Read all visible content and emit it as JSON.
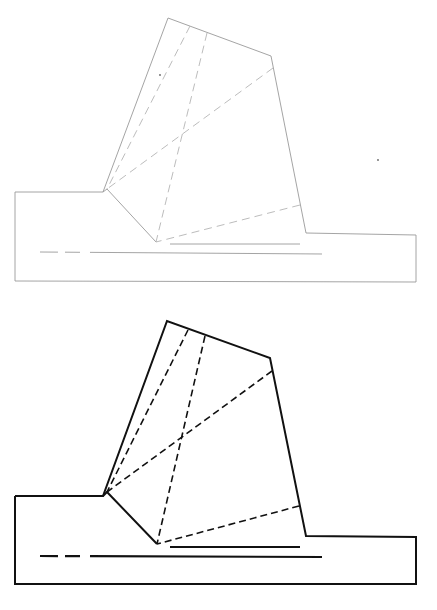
{
  "figure": {
    "panels": [
      {
        "id": "sketch",
        "style": "faint pencil",
        "stroke_color": "#9a9a9a",
        "outline": [
          [
            15,
            192
          ],
          [
            103,
            192
          ],
          [
            168,
            18
          ],
          [
            271,
            56
          ],
          [
            306,
            233
          ],
          [
            416,
            235
          ],
          [
            416,
            282
          ],
          [
            15,
            281
          ]
        ],
        "notch": [
          [
            103,
            192
          ],
          [
            107,
            189
          ],
          [
            156,
            242
          ]
        ],
        "dashed_lines": [
          [
            [
              190,
              26
            ],
            [
              107,
              189
            ]
          ],
          [
            [
              207,
              33
            ],
            [
              156,
              242
            ]
          ],
          [
            [
              273,
              68
            ],
            [
              107,
              189
            ]
          ],
          [
            [
              300,
              205
            ],
            [
              156,
              242
            ]
          ]
        ],
        "underlines": [
          {
            "type": "solid",
            "from": [
              170,
              244
            ],
            "to": [
              300,
              244
            ]
          },
          {
            "type": "dash-long",
            "from": [
              40,
              252
            ],
            "to": [
              322,
              254
            ]
          }
        ],
        "specks": [
          [
            378,
            160
          ],
          [
            160,
            75
          ]
        ]
      },
      {
        "id": "final",
        "style": "inked",
        "stroke_color": "#111111",
        "outline": [
          [
            15,
            196
          ],
          [
            103,
            196
          ],
          [
            167,
            21
          ],
          [
            270,
            58
          ],
          [
            306,
            236
          ],
          [
            416,
            237
          ],
          [
            416,
            284
          ],
          [
            15,
            284
          ]
        ],
        "notch": [
          [
            103,
            196
          ],
          [
            107,
            192
          ],
          [
            157,
            244
          ]
        ],
        "dashed_lines": [
          [
            [
              188,
              30
            ],
            [
              107,
              192
            ]
          ],
          [
            [
              205,
              36
            ],
            [
              157,
              244
            ]
          ],
          [
            [
              272,
              71
            ],
            [
              107,
              192
            ]
          ],
          [
            [
              299,
              206
            ],
            [
              157,
              244
            ]
          ]
        ],
        "underlines": [
          {
            "type": "solid",
            "from": [
              170,
              247
            ],
            "to": [
              300,
              247
            ]
          },
          {
            "type": "dash-long",
            "from": [
              40,
              256
            ],
            "to": [
              322,
              257
            ]
          }
        ]
      }
    ],
    "caption": ""
  }
}
